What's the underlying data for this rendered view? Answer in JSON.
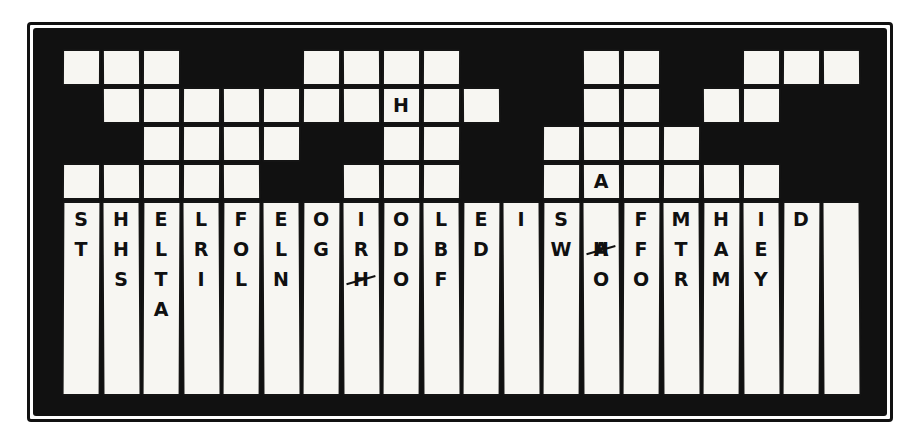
{
  "puzzle": {
    "type": "word-drop-puzzle",
    "title": "Hand-drawn word drop puzzle grid",
    "style": "hand-drawn ink on paper",
    "colors": {
      "ink": "#111111",
      "paper": "#f7f6f2",
      "background": "#ffffff"
    },
    "grid": {
      "columns": 20,
      "upper_rows": 4,
      "note": "Upper area: black field with scattered white (open) squares. Lower area: 20 tall white tray columns holding stacked letters.",
      "rows": [
        {
          "index": 0,
          "cells": [
            "white",
            "white",
            "white",
            "black",
            "black",
            "black",
            "white",
            "white",
            "white",
            "white",
            "black",
            "black",
            "black",
            "white",
            "white",
            "black",
            "black",
            "white",
            "white",
            "white"
          ]
        },
        {
          "index": 1,
          "cells": [
            "black",
            "white",
            "white",
            "white",
            "white",
            "white",
            "white",
            "white",
            "white",
            "white",
            "white",
            "black",
            "black",
            "white",
            "white",
            "black",
            "white",
            "white",
            "black",
            "black"
          ]
        },
        {
          "index": 2,
          "cells": [
            "black",
            "black",
            "white",
            "white",
            "white",
            "white",
            "black",
            "black",
            "white",
            "white",
            "black",
            "black",
            "white",
            "white",
            "white",
            "white",
            "black",
            "black",
            "black",
            "black"
          ]
        },
        {
          "index": 3,
          "cells": [
            "white",
            "white",
            "white",
            "white",
            "white",
            "black",
            "black",
            "white",
            "white",
            "white",
            "black",
            "black",
            "white",
            "white",
            "white",
            "white",
            "white",
            "white",
            "black",
            "black"
          ]
        }
      ],
      "marked_cells": [
        {
          "row": 1,
          "column": 8,
          "letter": "H"
        },
        {
          "row": 3,
          "column": 13,
          "letter": "A"
        }
      ]
    },
    "tray": {
      "note": "Twenty vertical tray columns; each holds a stack of unused letters read top to bottom.",
      "columns": [
        {
          "index": 0,
          "letters": [
            "S",
            "T"
          ]
        },
        {
          "index": 1,
          "letters": [
            "H",
            "H",
            "S"
          ]
        },
        {
          "index": 2,
          "letters": [
            "E",
            "L",
            "T",
            "A"
          ]
        },
        {
          "index": 3,
          "letters": [
            "L",
            "R",
            "I"
          ]
        },
        {
          "index": 4,
          "letters": [
            "F",
            "O",
            "L"
          ]
        },
        {
          "index": 5,
          "letters": [
            "E",
            "L",
            "N"
          ]
        },
        {
          "index": 6,
          "letters": [
            "O",
            "G"
          ]
        },
        {
          "index": 7,
          "letters": [
            "I",
            "R",
            "H"
          ],
          "struck": [
            2
          ]
        },
        {
          "index": 8,
          "letters": [
            "O",
            "D",
            "O"
          ]
        },
        {
          "index": 9,
          "letters": [
            "L",
            "B",
            "F"
          ]
        },
        {
          "index": 10,
          "letters": [
            "E",
            "D"
          ]
        },
        {
          "index": 11,
          "letters": [
            "I"
          ]
        },
        {
          "index": 12,
          "letters": [
            "S",
            "W"
          ]
        },
        {
          "index": 13,
          "letters": [
            "A",
            "H",
            "O"
          ],
          "struck": [
            0
          ]
        },
        {
          "index": 14,
          "letters": [
            "F",
            "F",
            "O"
          ]
        },
        {
          "index": 15,
          "letters": [
            "M",
            "T",
            "R"
          ]
        },
        {
          "index": 16,
          "letters": [
            "H",
            "A",
            "M"
          ]
        },
        {
          "index": 17,
          "letters": [
            "I",
            "E",
            "Y"
          ]
        },
        {
          "index": 18,
          "letters": [
            "D"
          ]
        },
        {
          "index": 19,
          "letters": []
        }
      ]
    }
  }
}
